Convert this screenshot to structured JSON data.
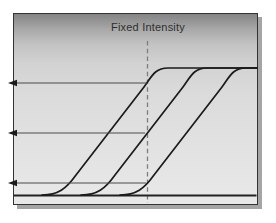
{
  "figure": {
    "title_label": "Fixed Intensity",
    "colors": {
      "page_background": "#ffffff",
      "box_border": "#333333",
      "box_shadow": "#a5a5a5",
      "gradient_top": "#848484",
      "gradient_bottom": "#e9e9e9",
      "curve": "#1b1b1b",
      "baseline": "#222222",
      "arrow_line": "#4a4a4a",
      "arrow_head": "#1a1a1a",
      "dashed_line": "#7d7d7d",
      "label_text": "#2e2e2e"
    },
    "geometry": {
      "canvas": {
        "width": 276,
        "height": 223
      },
      "box": {
        "x": 13,
        "y": 13,
        "width": 245,
        "height": 192
      },
      "plateau_y": 68,
      "baseline_y": 195.5,
      "baseline_x_from": 14,
      "baseline_x_to": 256.5,
      "right_edge_x": 257,
      "dashed_line": {
        "x": 147.5,
        "y_top": 41,
        "y_bottom": 203,
        "dash": "4.5 3.2"
      },
      "curve_base": {
        "foot_x": 42,
        "diag": {
          "x1": 76,
          "y1": 175,
          "x2": 144,
          "y2": 87
        }
      },
      "curve_offsets_x": [
        0,
        39,
        78
      ],
      "arrows": [
        {
          "y": 83,
          "x_from": 147,
          "x_to": 8
        },
        {
          "y": 133,
          "x_from": 145,
          "x_to": 8
        },
        {
          "y": 183,
          "x_from": 146,
          "x_to": 8
        }
      ]
    }
  }
}
